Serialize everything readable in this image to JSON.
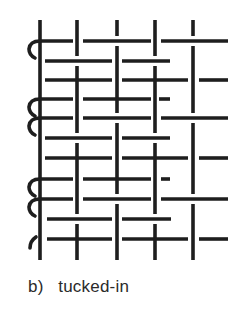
{
  "figure": {
    "caption": "b)   tucked-in",
    "stroke_color": "#1e1e1e",
    "background": "#ffffff"
  },
  "diagram": {
    "type": "weave-structure",
    "warps_x": [
      40,
      77,
      117,
      155,
      193
    ],
    "warp_top": 20,
    "warp_bottom": 260,
    "rows": [
      {
        "y": 41,
        "curl": "full",
        "segments": [
          [
            40,
            73
          ],
          [
            83,
            151
          ],
          [
            161,
            228
          ]
        ]
      },
      {
        "y": 61,
        "curl": "none",
        "segments": [
          [
            45,
            112
          ],
          [
            122,
            170
          ]
        ]
      },
      {
        "y": 80,
        "curl": "none",
        "segments": [
          [
            45,
            112
          ],
          [
            122,
            188
          ],
          [
            199,
            228
          ]
        ]
      },
      {
        "y": 99,
        "curl": "full",
        "segments": [
          [
            40,
            73
          ],
          [
            83,
            151
          ],
          [
            159,
            170
          ]
        ]
      },
      {
        "y": 118,
        "curl": "full",
        "segments": [
          [
            40,
            73
          ],
          [
            83,
            151
          ],
          [
            161,
            228
          ]
        ]
      },
      {
        "y": 138,
        "curl": "none",
        "segments": [
          [
            45,
            112
          ],
          [
            122,
            170
          ]
        ]
      },
      {
        "y": 158,
        "curl": "none",
        "segments": [
          [
            45,
            112
          ],
          [
            122,
            188
          ],
          [
            199,
            228
          ]
        ]
      },
      {
        "y": 179,
        "curl": "full",
        "segments": [
          [
            40,
            73
          ],
          [
            83,
            151
          ],
          [
            161,
            170
          ]
        ]
      },
      {
        "y": 199,
        "curl": "full",
        "segments": [
          [
            40,
            73
          ],
          [
            83,
            151
          ],
          [
            161,
            228
          ]
        ]
      },
      {
        "y": 219,
        "curl": "none",
        "segments": [
          [
            47,
            112
          ],
          [
            122,
            171
          ]
        ]
      },
      {
        "y": 239,
        "curl": "small",
        "segments": [
          [
            47,
            112
          ],
          [
            122,
            188
          ],
          [
            199,
            228
          ]
        ]
      }
    ],
    "curl_pairs": [
      [
        41,
        61
      ],
      [
        99,
        118
      ],
      [
        118,
        138
      ],
      [
        179,
        199
      ],
      [
        199,
        219
      ]
    ]
  }
}
